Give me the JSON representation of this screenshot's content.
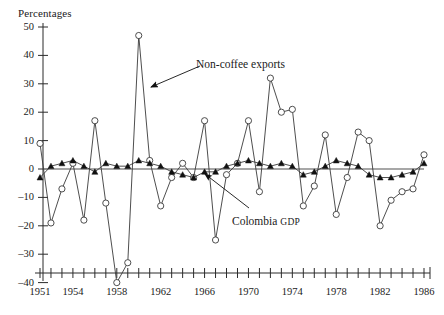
{
  "chart_data": {
    "type": "line",
    "title": "",
    "ylabel": "Percentages",
    "xlabel": "",
    "ylim": [
      -40,
      50
    ],
    "ytick_step": 10,
    "yticks": [
      50,
      40,
      30,
      20,
      10,
      0,
      -10,
      -20,
      -30,
      -40
    ],
    "xlim": [
      1951,
      1986
    ],
    "xticks_labeled": [
      1951,
      1954,
      1958,
      1962,
      1966,
      1970,
      1974,
      1978,
      1982,
      1986
    ],
    "xtick_step_minor": 1,
    "grid": false,
    "legend": "annotations-inline",
    "x": [
      1951,
      1952,
      1953,
      1954,
      1955,
      1956,
      1957,
      1958,
      1959,
      1960,
      1961,
      1962,
      1963,
      1964,
      1965,
      1966,
      1967,
      1968,
      1969,
      1970,
      1971,
      1972,
      1973,
      1974,
      1975,
      1976,
      1977,
      1978,
      1979,
      1980,
      1981,
      1982,
      1983,
      1984,
      1985,
      1986
    ],
    "series": [
      {
        "name": "Non-coffee exports",
        "marker": "open-circle",
        "values": [
          9,
          -19,
          -7,
          2,
          -18,
          17,
          -12,
          -40,
          -33,
          47,
          3,
          -13,
          -3,
          2,
          -3,
          17,
          -25,
          -2,
          2,
          17,
          -8,
          32,
          20,
          21,
          -13,
          -6,
          12,
          -16,
          -3,
          13,
          10,
          -20,
          -11,
          -8,
          -7,
          5
        ]
      },
      {
        "name": "Colombia GDP",
        "marker": "filled-triangle",
        "values": [
          -3,
          1,
          2,
          3,
          1,
          -1,
          2,
          1,
          1,
          3,
          2,
          1,
          -1,
          -2,
          -3,
          -1,
          -1,
          1,
          2,
          3,
          2,
          1,
          2,
          1,
          -2,
          -1,
          1,
          3,
          2,
          1,
          -2,
          -3,
          -3,
          -2,
          -1,
          2
        ]
      }
    ],
    "annotations": [
      {
        "name": "non-coffee-exports",
        "text": "Non-coffee exports",
        "text_x": 196,
        "text_y": 58,
        "arrow_from_x": 200,
        "arrow_from_y": 66,
        "arrow_to_x": 151,
        "arrow_to_y": 87
      },
      {
        "name": "colombia-gdp",
        "text_lead": "Colombia ",
        "text_small": "GDP",
        "text_x": 232,
        "text_y": 215,
        "arrow_from_x": 249,
        "arrow_from_y": 208,
        "arrow_to_x": 205,
        "arrow_to_y": 174
      }
    ],
    "colors": {
      "axis": "#2b2b2b",
      "series_line": "#3a3a3a",
      "marker_fill": "#ffffff",
      "gdp_marker": "#111111",
      "text": "#1a1a1a"
    }
  }
}
